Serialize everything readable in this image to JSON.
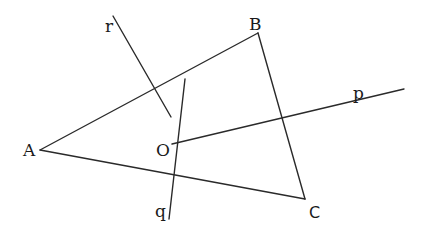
{
  "diagram": {
    "stroke_color": "#2a2a2a",
    "points": {
      "A": {
        "label": "A",
        "x": 40,
        "y": 150
      },
      "B": {
        "label": "B",
        "x": 258,
        "y": 33
      },
      "C": {
        "label": "C",
        "x": 305,
        "y": 199
      },
      "O": {
        "label": "O",
        "x": 172,
        "y": 144
      }
    },
    "triangle": [
      "A",
      "B",
      "C"
    ],
    "lines": {
      "p": {
        "label": "p",
        "x1": 172,
        "y1": 144,
        "x2": 404,
        "y2": 89
      },
      "q": {
        "label": "q",
        "x1": 185,
        "y1": 79,
        "x2": 169,
        "y2": 219
      },
      "r": {
        "label": "r",
        "x1": 113,
        "y1": 16,
        "x2": 171,
        "y2": 117
      }
    }
  }
}
